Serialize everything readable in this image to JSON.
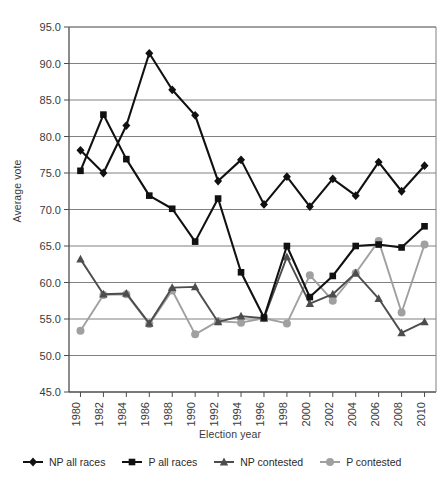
{
  "chart_data": {
    "type": "line",
    "title": "",
    "xlabel": "Election year",
    "ylabel": "Average vote",
    "ylim": [
      45.0,
      95.0
    ],
    "ytick_step": 5.0,
    "yticks": [
      "45.0",
      "50.0",
      "55.0",
      "60.0",
      "65.0",
      "70.0",
      "75.0",
      "80.0",
      "85.0",
      "90.0",
      "95.0"
    ],
    "grid": "horizontal",
    "legend_position": "bottom",
    "x": [
      1980,
      1982,
      1984,
      1986,
      1988,
      1990,
      1992,
      1994,
      1996,
      1998,
      2000,
      2002,
      2004,
      2006,
      2008,
      2010
    ],
    "categories": [
      "1980",
      "1982",
      "1984",
      "1986",
      "1988",
      "1990",
      "1992",
      "1994",
      "1996",
      "1998",
      "2000",
      "2002",
      "2004",
      "2006",
      "2008",
      "2010"
    ],
    "series": [
      {
        "name": "NP all races",
        "marker": "diamond",
        "color": "#111111",
        "values": [
          78.1,
          75.0,
          81.5,
          91.4,
          86.4,
          82.9,
          73.9,
          76.8,
          70.7,
          74.5,
          70.4,
          74.2,
          71.9,
          76.5,
          72.5,
          76.0
        ]
      },
      {
        "name": "P all races",
        "marker": "square",
        "color": "#111111",
        "values": [
          75.3,
          83.0,
          76.9,
          71.9,
          70.1,
          65.6,
          71.5,
          61.4,
          55.2,
          65.0,
          58.0,
          60.9,
          65.0,
          65.2,
          64.8,
          67.7
        ]
      },
      {
        "name": "NP contested",
        "marker": "triangle",
        "color": "#4d4d4d",
        "values": [
          63.2,
          58.4,
          58.5,
          54.4,
          59.3,
          59.4,
          54.6,
          55.4,
          55.1,
          63.5,
          57.1,
          58.4,
          61.3,
          57.8,
          53.1,
          54.6
        ]
      },
      {
        "name": "P contested",
        "marker": "circle",
        "color": "#a0a0a0",
        "values": [
          53.4,
          58.3,
          58.4,
          54.3,
          58.9,
          52.9,
          54.7,
          54.5,
          55.1,
          54.4,
          61.0,
          57.5,
          61.3,
          65.7,
          55.9,
          65.2
        ]
      }
    ]
  },
  "axes": {
    "x_title": "Election year",
    "y_title": "Average vote"
  },
  "legend": {
    "items": [
      {
        "label": "NP all races",
        "marker": "diamond-marker-icon",
        "color": "#111111"
      },
      {
        "label": "P all races",
        "marker": "square-marker-icon",
        "color": "#111111"
      },
      {
        "label": "NP contested",
        "marker": "triangle-marker-icon",
        "color": "#4d4d4d"
      },
      {
        "label": "P contested",
        "marker": "circle-marker-icon",
        "color": "#a0a0a0"
      }
    ]
  }
}
